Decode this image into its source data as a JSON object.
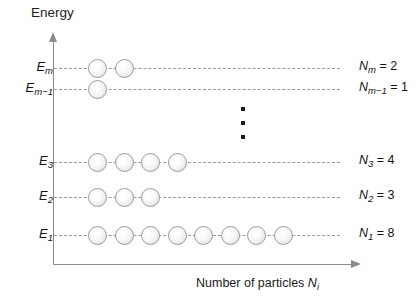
{
  "figure": {
    "title_y": "Energy",
    "title_x_text": "Number of particles ",
    "title_x_symbol": "N",
    "title_x_subscript": "i"
  },
  "chart_data": {
    "type": "scatter",
    "title": "",
    "xlabel": "Number of particles N_i",
    "ylabel": "Energy",
    "grid": false,
    "legend": "none",
    "annotations": [
      "vertical-ellipsis between E_3 and E_m-1"
    ],
    "categories": [
      "E_1",
      "E_2",
      "E_3",
      "E_m-1",
      "E_m"
    ],
    "values": [
      8,
      3,
      4,
      1,
      2
    ],
    "levels": [
      {
        "id": "Em",
        "label_symbol": "E",
        "label_sub": "m",
        "count_symbol": "N",
        "count_sub": "m",
        "count_text": "= 2",
        "count": 2,
        "y": 68,
        "dash_width": 286
      },
      {
        "id": "Em-1",
        "label_symbol": "E",
        "label_sub": "m−1",
        "count_symbol": "N",
        "count_sub": "m−1",
        "count_text": "= 1",
        "count": 1,
        "y": 89,
        "dash_width": 286
      },
      {
        "id": "E3",
        "label_symbol": "E",
        "label_sub": "3",
        "count_symbol": "N",
        "count_sub": "3",
        "count_text": "= 4",
        "count": 4,
        "y": 162,
        "dash_width": 286
      },
      {
        "id": "E2",
        "label_symbol": "E",
        "label_sub": "2",
        "count_symbol": "N",
        "count_sub": "2",
        "count_text": "= 3",
        "count": 3,
        "y": 197,
        "dash_width": 286
      },
      {
        "id": "E1",
        "label_symbol": "E",
        "label_sub": "1",
        "count_symbol": "N",
        "count_sub": "1",
        "count_text": "= 8",
        "count": 8,
        "y": 235,
        "dash_width": 286
      }
    ],
    "particle_start_x": 88,
    "particle_spacing": 26.5,
    "particle_diameter": 19
  }
}
